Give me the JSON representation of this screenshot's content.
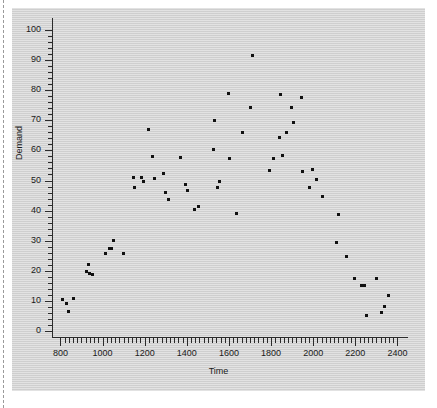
{
  "chart_data": {
    "type": "scatter",
    "title": "",
    "xlabel": "Time",
    "ylabel": "Demand",
    "xlim": [
      760,
      2450
    ],
    "ylim": [
      -2,
      104
    ],
    "grid": false,
    "legend": null,
    "x_ticks": [
      800,
      1000,
      1200,
      1400,
      1600,
      1800,
      2000,
      2200,
      2400
    ],
    "x_tick_labels": [
      "800",
      "1000",
      "1200",
      "1400",
      "1600",
      "1800",
      "2000",
      "2200",
      "2400"
    ],
    "x_minor_step": 20,
    "y_ticks": [
      0,
      10,
      20,
      30,
      40,
      50,
      60,
      70,
      80,
      90,
      100
    ],
    "y_tick_labels": [
      "0",
      "10",
      "20",
      "30",
      "40",
      "50",
      "60",
      "70",
      "80",
      "90",
      "100"
    ],
    "y_minor_step": 2,
    "marker": "square",
    "marker_color": "#111111",
    "panel_color": "#d6d6d6",
    "points": [
      [
        812,
        10.6
      ],
      [
        828,
        9.2
      ],
      [
        840,
        6.6
      ],
      [
        862,
        10.9
      ],
      [
        922,
        19.9
      ],
      [
        932,
        22.1
      ],
      [
        938,
        19.0
      ],
      [
        952,
        18.8
      ],
      [
        1014,
        25.7
      ],
      [
        1032,
        27.3
      ],
      [
        1042,
        27.4
      ],
      [
        1054,
        30.0
      ],
      [
        1098,
        25.6
      ],
      [
        1148,
        51.1
      ],
      [
        1152,
        47.6
      ],
      [
        1186,
        51.0
      ],
      [
        1196,
        49.6
      ],
      [
        1216,
        66.9
      ],
      [
        1238,
        58.0
      ],
      [
        1248,
        50.8
      ],
      [
        1288,
        52.4
      ],
      [
        1300,
        46.1
      ],
      [
        1312,
        43.8
      ],
      [
        1372,
        57.7
      ],
      [
        1392,
        48.7
      ],
      [
        1404,
        46.8
      ],
      [
        1436,
        40.3
      ],
      [
        1456,
        41.5
      ],
      [
        1528,
        60.3
      ],
      [
        1530,
        70.0
      ],
      [
        1544,
        47.7
      ],
      [
        1556,
        49.6
      ],
      [
        1596,
        78.9
      ],
      [
        1602,
        57.3
      ],
      [
        1634,
        39.1
      ],
      [
        1664,
        66.1
      ],
      [
        1702,
        74.3
      ],
      [
        1712,
        91.7
      ],
      [
        1792,
        53.2
      ],
      [
        1812,
        57.4
      ],
      [
        1838,
        64.2
      ],
      [
        1846,
        78.5
      ],
      [
        1852,
        58.2
      ],
      [
        1872,
        66.0
      ],
      [
        1896,
        74.1
      ],
      [
        1908,
        69.3
      ],
      [
        1946,
        77.6
      ],
      [
        1950,
        53.0
      ],
      [
        1984,
        47.7
      ],
      [
        1996,
        53.8
      ],
      [
        2014,
        50.4
      ],
      [
        2042,
        44.7
      ],
      [
        2112,
        29.3
      ],
      [
        2118,
        38.6
      ],
      [
        2158,
        24.9
      ],
      [
        2196,
        17.6
      ],
      [
        2230,
        15.2
      ],
      [
        2244,
        15.1
      ],
      [
        2252,
        5.0
      ],
      [
        2300,
        17.4
      ],
      [
        2326,
        6.0
      ],
      [
        2338,
        8.1
      ],
      [
        2356,
        11.9
      ]
    ]
  }
}
